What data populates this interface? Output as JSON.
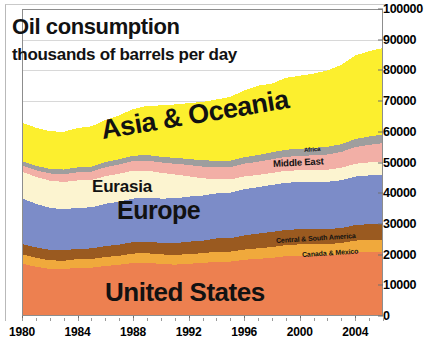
{
  "chart_data": {
    "type": "area",
    "title": "Oil consumption",
    "subtitle": "thousands of barrels per day",
    "xlabel": "",
    "ylabel": "",
    "stacked": true,
    "grid": true,
    "legend_position": "in-plot-labels",
    "xlim": [
      1980,
      2006
    ],
    "ylim": [
      0,
      100000
    ],
    "x_tick_labels": [
      "1980",
      "1984",
      "1988",
      "1992",
      "1996",
      "2000",
      "2004"
    ],
    "x_ticks": [
      1980,
      1984,
      1988,
      1992,
      1996,
      2000,
      2004
    ],
    "y_tick_labels": [
      "0",
      "10000",
      "20000",
      "30000",
      "40000",
      "50000",
      "60000",
      "70000",
      "80000",
      "90000",
      "100000"
    ],
    "y_ticks": [
      0,
      10000,
      20000,
      30000,
      40000,
      50000,
      60000,
      70000,
      80000,
      90000,
      100000
    ],
    "x": [
      1980,
      1981,
      1982,
      1983,
      1984,
      1985,
      1986,
      1987,
      1988,
      1989,
      1990,
      1991,
      1992,
      1993,
      1994,
      1995,
      1996,
      1997,
      1998,
      1999,
      2000,
      2001,
      2002,
      2003,
      2004,
      2005,
      2006
    ],
    "series": [
      {
        "name": "United States",
        "color": "#ED8050",
        "label": "United States",
        "values": [
          17060,
          16060,
          15300,
          15230,
          15720,
          15730,
          16280,
          16670,
          17280,
          17320,
          16990,
          16710,
          17030,
          17240,
          17720,
          17720,
          18310,
          18620,
          18920,
          19520,
          19700,
          19650,
          19760,
          20030,
          20730,
          20800,
          20690
        ]
      },
      {
        "name": "Canada & Mexico",
        "color": "#F0A93C",
        "label": "Canada & Mexico",
        "values": [
          3000,
          2910,
          2830,
          2770,
          2800,
          2830,
          2900,
          2960,
          3060,
          3110,
          3100,
          3110,
          3170,
          3190,
          3260,
          3240,
          3330,
          3440,
          3520,
          3570,
          3630,
          3640,
          3670,
          3730,
          3840,
          3900,
          3930
        ]
      },
      {
        "name": "Central & South America",
        "color": "#9A5A20",
        "label": "Central & South America",
        "values": [
          3350,
          3380,
          3400,
          3350,
          3400,
          3440,
          3560,
          3630,
          3720,
          3740,
          3760,
          3880,
          4000,
          4110,
          4260,
          4400,
          4570,
          4790,
          4950,
          4930,
          4960,
          4980,
          4880,
          4880,
          5050,
          5200,
          5320
        ]
      },
      {
        "name": "Europe",
        "color": "#7C8CC8",
        "label": "Europe",
        "values": [
          14900,
          14200,
          13700,
          13400,
          13300,
          13400,
          13800,
          14000,
          14200,
          14300,
          14400,
          14600,
          14700,
          14700,
          14700,
          14800,
          15100,
          15100,
          15300,
          15400,
          15300,
          15400,
          15400,
          15600,
          15800,
          15900,
          16000
        ]
      },
      {
        "name": "Eurasia",
        "color": "#FCF4D0",
        "label": "Eurasia",
        "values": [
          8700,
          8800,
          8850,
          8900,
          8950,
          8900,
          9000,
          9100,
          9050,
          8900,
          8400,
          7800,
          6600,
          5600,
          4700,
          4300,
          4150,
          4000,
          3900,
          3900,
          3850,
          3900,
          3950,
          4050,
          4150,
          4250,
          4400
        ]
      },
      {
        "name": "Middle East",
        "color": "#F2AFA6",
        "label": "Middle East",
        "values": [
          2000,
          2150,
          2350,
          2500,
          2650,
          2750,
          2900,
          3000,
          3150,
          3250,
          3400,
          3500,
          3700,
          3850,
          3950,
          4050,
          4150,
          4300,
          4450,
          4550,
          4650,
          4800,
          4950,
          5150,
          5450,
          5700,
          5950
        ]
      },
      {
        "name": "Africa",
        "color": "#9E9E9E",
        "label": "Africa",
        "values": [
          1400,
          1450,
          1500,
          1550,
          1600,
          1620,
          1680,
          1700,
          1750,
          1800,
          1850,
          1900,
          1950,
          2000,
          2020,
          2060,
          2120,
          2180,
          2250,
          2300,
          2350,
          2420,
          2480,
          2530,
          2620,
          2720,
          2820
        ]
      },
      {
        "name": "Asia & Oceania",
        "color": "#FCEF2E",
        "label": "Asia & Oceania",
        "values": [
          12500,
          12400,
          12250,
          12300,
          12800,
          13100,
          13700,
          14300,
          15200,
          16000,
          16700,
          17400,
          18200,
          19000,
          19900,
          20800,
          21700,
          22600,
          22400,
          23400,
          23800,
          24200,
          24900,
          25800,
          27200,
          27800,
          28200
        ]
      }
    ]
  },
  "labels": {
    "title": "Oil consumption",
    "subtitle": "thousands of barrels per day",
    "asia_oceania": "Asia & Oceania",
    "eurasia": "Eurasia",
    "europe": "Europe",
    "united_states": "United States",
    "africa": "Africa",
    "middle_east": "Middle East",
    "central_south_america": "Central & South America",
    "canada_mexico": "Canada & Mexico"
  }
}
